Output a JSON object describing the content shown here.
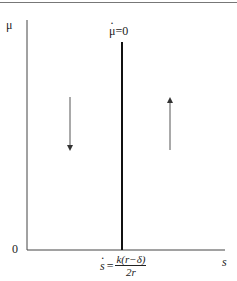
{
  "diagram": {
    "y_axis_label": "μ",
    "x_axis_label": "s",
    "origin_label": "0",
    "isocline_label": "μ=0",
    "isocline_label_dot_symbol": "μ",
    "isocline_rest": "=0",
    "steady_state_lhs": "s",
    "steady_state_eq": "=",
    "steady_state_numerator": "k(r−δ)",
    "steady_state_denominator": "2r",
    "arrows": [
      {
        "side": "left",
        "direction": "down"
      },
      {
        "side": "right",
        "direction": "up"
      }
    ],
    "colors": {
      "line": "#222222",
      "arrow": "#555555",
      "top_rule": "#777777"
    }
  }
}
